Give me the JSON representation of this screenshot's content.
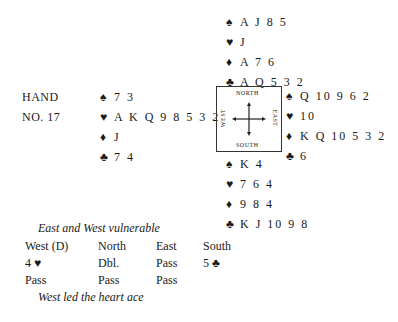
{
  "hand": {
    "label_line1": "HAND",
    "label_line2": "NO. 17"
  },
  "north": {
    "spades": "A J 8 5",
    "hearts": "J",
    "diamonds": "A 7 6",
    "clubs": "A Q 5 3 2"
  },
  "west": {
    "spades": "7 3",
    "hearts": "A K Q 9 8 5 3 2",
    "diamonds": "J",
    "clubs": "7 4"
  },
  "east": {
    "spades": "Q 10 9 6 2",
    "hearts": "10",
    "diamonds": "K Q 10 5 3 2",
    "clubs": "6"
  },
  "south": {
    "spades": "K 4",
    "hearts": "7 6 4",
    "diamonds": "9 8 4",
    "clubs": "K J 10 9 8"
  },
  "compass": {
    "north": "NORTH",
    "south": "SOUTH",
    "east": "EAST",
    "west": "WEST"
  },
  "icons": {
    "spade": "♠",
    "heart": "♥",
    "diamond": "♦",
    "club": "♣"
  },
  "vulnerability": "East and West vulnerable",
  "auction": {
    "headers": [
      "West (D)",
      "North",
      "East",
      "South"
    ],
    "rows": [
      [
        "4 ♥",
        "Dbl.",
        "Pass",
        "5 ♣"
      ],
      [
        "Pass",
        "Pass",
        "Pass",
        ""
      ]
    ]
  },
  "lead": "West led the heart ace"
}
